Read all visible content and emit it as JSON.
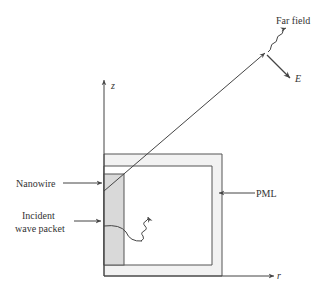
{
  "diagram": {
    "labels": {
      "far_field": "Far field",
      "e_field": "E",
      "z_axis": "z",
      "r_axis": "r",
      "pml": "PML",
      "nanowire": "Nanowire",
      "incident_line1": "Incident",
      "incident_line2": "wave packet"
    },
    "colors": {
      "line": "#444444",
      "nanowire_fill": "#d9d9d9",
      "pml_fill": "#f2f2f2"
    }
  }
}
